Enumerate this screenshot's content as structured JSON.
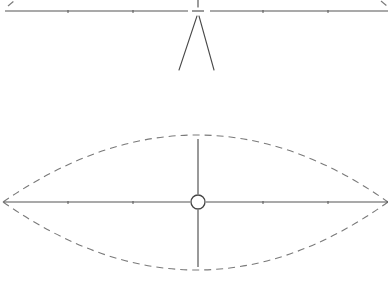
{
  "diagram": {
    "colors": {
      "line": "#4a4a4a",
      "dashed": "#7a7a7a",
      "background": "#ffffff"
    },
    "top_view": {
      "axis_y": 11,
      "axis_x_range": [
        5,
        388
      ],
      "center_x": 198,
      "tick_positions": [
        68,
        133,
        263,
        328
      ],
      "beam": {
        "apex": [
          198,
          15
        ],
        "left_end": [
          179,
          70
        ],
        "right_end": [
          214,
          70
        ]
      }
    },
    "bottom_view": {
      "axis_y": 202,
      "axis_x_range": [
        3,
        388
      ],
      "center": [
        198,
        202
      ],
      "center_marker_radius": 7,
      "vertical_axis_y_range": [
        139,
        267
      ],
      "tick_positions": [
        68,
        133,
        263,
        328
      ],
      "envelope": {
        "style": "dashed",
        "left_tip": [
          3,
          202
        ],
        "right_tip": [
          388,
          202
        ],
        "top_y": 134,
        "bottom_y": 271
      }
    }
  }
}
